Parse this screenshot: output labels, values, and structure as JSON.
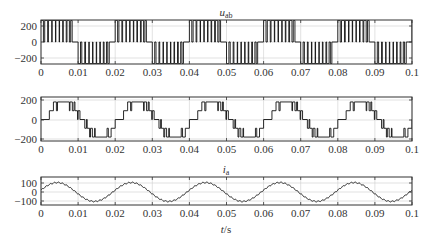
{
  "chart_data": [
    {
      "type": "line",
      "title": "u_ab",
      "title_main": "u",
      "title_sub": "ab",
      "xlabel": "",
      "ylabel": "",
      "xlim": [
        0,
        0.1
      ],
      "ylim": [
        -300,
        300
      ],
      "xticks": [
        "0",
        "0.01",
        "0.02",
        "0.03",
        "0.04",
        "0.05",
        "0.06",
        "0.07",
        "0.08",
        "0.09",
        "0.1"
      ],
      "yticks": [
        "200",
        "0",
        "-200"
      ],
      "grid": true,
      "description": "PWM line voltage, 3-level bipolar pulses: +/-270 V pulse trains in half cycles of 50 Hz",
      "frequency_hz": 50,
      "pulse_amplitude": 270,
      "levels": [
        -270,
        0,
        270
      ]
    },
    {
      "type": "line",
      "title": "",
      "xlabel": "",
      "ylabel": "",
      "xlim": [
        0,
        0.1
      ],
      "ylim": [
        -230,
        230
      ],
      "xticks": [
        "0",
        "0.01",
        "0.02",
        "0.03",
        "0.04",
        "0.05",
        "0.06",
        "0.07",
        "0.08",
        "0.09",
        "0.1"
      ],
      "yticks": [
        "200",
        "0",
        "-200"
      ],
      "grid": true,
      "description": "Phase voltage, multilevel PWM staircase with levels 0, +/-90, +/-180",
      "frequency_hz": 50,
      "levels": [
        -180,
        -90,
        0,
        90,
        180
      ]
    },
    {
      "type": "line",
      "title": "i_a",
      "title_main": "i",
      "title_sub": "a",
      "xlabel": "t/s",
      "xlabel_main": "t",
      "xlabel_unit": "/s",
      "ylabel": "",
      "xlim": [
        0,
        0.1
      ],
      "ylim": [
        -130,
        130
      ],
      "xticks": [
        "0",
        "0.01",
        "0.02",
        "0.03",
        "0.04",
        "0.05",
        "0.06",
        "0.07",
        "0.08",
        "0.09",
        "0.1"
      ],
      "yticks": [
        "100",
        "0",
        "-100"
      ],
      "grid": true,
      "description": "Phase current, near-sinusoidal with small ripple, amplitude ~105, 50 Hz, phase lag",
      "frequency_hz": 50,
      "amplitude": 105,
      "x": [
        0,
        0.005,
        0.01,
        0.015,
        0.02,
        0.025,
        0.03,
        0.035,
        0.04,
        0.045,
        0.05,
        0.055,
        0.06,
        0.065,
        0.07,
        0.075,
        0.08,
        0.085,
        0.09,
        0.095,
        0.1
      ],
      "values": [
        20,
        100,
        35,
        -95,
        -25,
        100,
        35,
        -95,
        -25,
        100,
        35,
        -95,
        -25,
        100,
        35,
        -95,
        -25,
        100,
        35,
        -95,
        -25
      ]
    }
  ]
}
